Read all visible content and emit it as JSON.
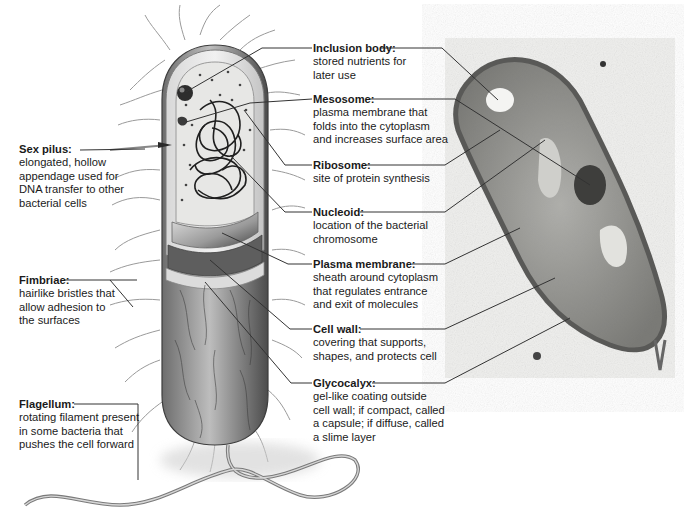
{
  "figure": {
    "panels": [
      "illustration",
      "electron-micrograph"
    ]
  },
  "labels": {
    "inclusion_body": {
      "title": "Inclusion body:",
      "desc": "stored nutrients for\nlater use"
    },
    "mesosome": {
      "title": "Mesosome:",
      "desc": "plasma membrane that\nfolds into the cytoplasm\nand increases surface area"
    },
    "ribosome": {
      "title": "Ribosome:",
      "desc": "site of protein synthesis"
    },
    "nucleoid": {
      "title": "Nucleoid:",
      "desc": "location of the bacterial\nchromosome"
    },
    "plasma_membrane": {
      "title": "Plasma membrane:",
      "desc": "sheath around cytoplasm\nthat regulates entrance\nand exit of molecules"
    },
    "cell_wall": {
      "title": "Cell wall:",
      "desc": "covering that supports,\nshapes, and protects cell"
    },
    "glycocalyx": {
      "title": "Glycocalyx:",
      "desc": "gel-like coating outside\ncell wall; if compact, called\na capsule; if diffuse, called\na slime layer"
    },
    "sex_pilus": {
      "title": "Sex pilus:",
      "desc": "elongated, hollow\nappendage used for\nDNA transfer to other\nbacterial cells"
    },
    "fimbriae": {
      "title": "Fimbriae:",
      "desc": "hairlike bristles that\nallow adhesion to\nthe surfaces"
    },
    "flagellum": {
      "title": "Flagellum:",
      "desc": "rotating filament present\nin some bacteria that\npushes the cell forward"
    }
  },
  "colors": {
    "leader_line": "#333333",
    "cell_body_dark": "#5a5a5a",
    "cell_body_light": "#b8b8b8",
    "micrograph_bg": "#eeeeec",
    "micrograph_cell": "#8a8a86"
  }
}
